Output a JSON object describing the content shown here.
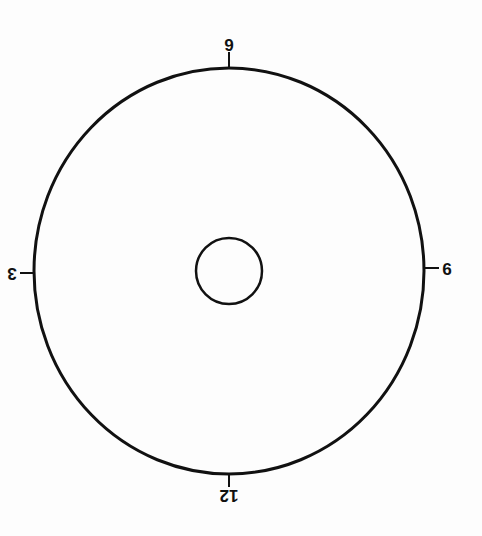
{
  "diagram": {
    "type": "clock-dial",
    "orientation_degrees": 180,
    "colors": {
      "background": "#fdfdfd",
      "stroke": "#111111"
    },
    "outer_circle": {
      "cx": 229,
      "cy": 271,
      "rx": 195,
      "ry": 203,
      "stroke_width": 3
    },
    "inner_circle": {
      "cx": 229,
      "cy": 271,
      "r": 33,
      "stroke_width": 2.5
    },
    "labels": {
      "twelve": "12",
      "three": "3",
      "six": "6",
      "nine": "9"
    }
  }
}
